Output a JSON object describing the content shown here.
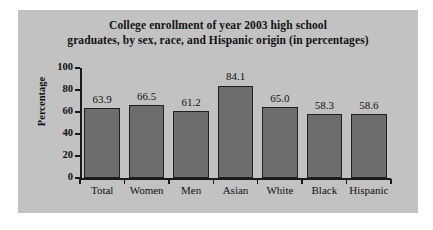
{
  "figure": {
    "background_color": "#c2c2c2",
    "page_background_color": "#ffffff"
  },
  "chart_data": {
    "type": "bar",
    "title": "College enrollment of year 2003 high school graduates, by sex, race, and Hispanic origin (in percentages)",
    "title_line1": "College enrollment of year 2003 high school",
    "title_line2": "graduates, by sex, race, and Hispanic origin (in percentages)",
    "xlabel": "",
    "ylabel": "Percentage",
    "categories": [
      "Total",
      "Women",
      "Men",
      "Asian",
      "White",
      "Black",
      "Hispanic"
    ],
    "values": [
      63.9,
      66.5,
      61.2,
      84.1,
      65.0,
      58.3,
      58.6
    ],
    "value_labels": [
      "63.9",
      "66.5",
      "61.2",
      "84.1",
      "65.0",
      "58.3",
      "58.6"
    ],
    "ylim": [
      0,
      100
    ],
    "yticks": [
      0,
      20,
      40,
      60,
      80,
      100
    ],
    "ytick_labels": [
      "0",
      "20",
      "40",
      "60",
      "80",
      "100"
    ],
    "grid": false,
    "legend": null,
    "bar_color": "#6d6d6d",
    "bar_edge_color": "#1f1f1f",
    "axis_color": "#1a1a1a"
  }
}
